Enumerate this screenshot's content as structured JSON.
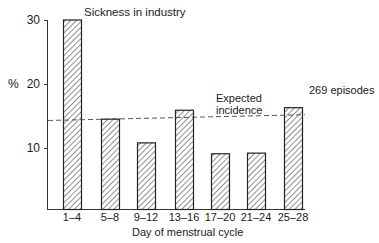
{
  "chart_data": {
    "type": "bar",
    "title": "Sickness in industry",
    "xlabel": "Day of menstrual cycle",
    "ylabel": "%",
    "categories": [
      "1–4",
      "5–8",
      "9–12",
      "13–16",
      "17–20",
      "21–24",
      "25–28"
    ],
    "values": [
      30,
      14.5,
      10.8,
      15.9,
      9.1,
      9.2,
      16.3
    ],
    "ylim": [
      0,
      30
    ],
    "yticks": [
      10,
      20,
      30
    ],
    "grid": false,
    "bar_fill": "diagonal-hatch",
    "reference_line": {
      "label": "Expected incidence",
      "style": "dashed",
      "y_start": 14.3,
      "y_end": 15.2
    },
    "annotations": [
      "Sickness in industry",
      "Expected incidence",
      "269 episodes"
    ],
    "legend": null
  },
  "labels": {
    "title": "Sickness in industry",
    "ylabel": "%",
    "xlabel": "Day of menstrual cycle",
    "expected_line1": "Expected",
    "expected_line2": "incidence",
    "episodes": "269 episodes",
    "ytick_10": "10",
    "ytick_20": "20",
    "ytick_30": "30",
    "cat_0": "1–4",
    "cat_1": "5–8",
    "cat_2": "9–12",
    "cat_3": "13–16",
    "cat_4": "17–20",
    "cat_5": "21–24",
    "cat_6": "25–28"
  },
  "colors": {
    "ink": "#1a1a1a",
    "background": "#ffffff"
  }
}
